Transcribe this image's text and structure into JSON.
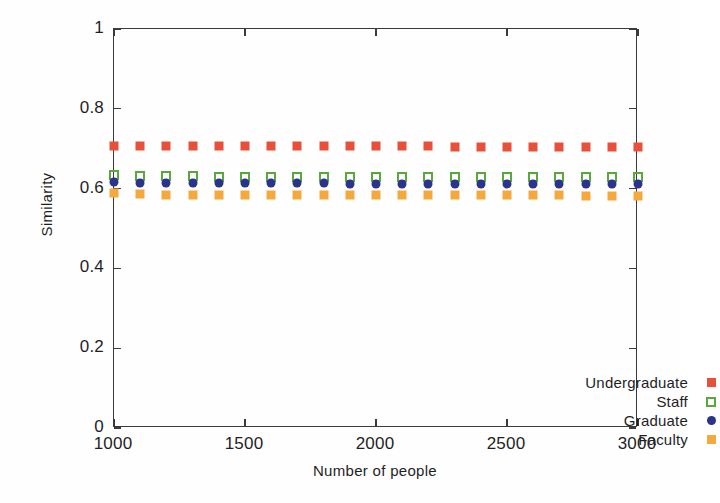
{
  "chart_data": {
    "type": "scatter",
    "title": "",
    "xlabel": "Number of people",
    "ylabel": "Similarity",
    "xlim": [
      1000,
      3000
    ],
    "ylim": [
      0,
      1
    ],
    "xticks": [
      "1000",
      "1500",
      "2000",
      "2500",
      "3000"
    ],
    "xtick_values": [
      1000,
      1500,
      2000,
      2500,
      3000
    ],
    "yticks": [
      "0",
      "0.2",
      "0.4",
      "0.6",
      "0.8",
      "1"
    ],
    "ytick_values": [
      0,
      0.2,
      0.4,
      0.6,
      0.8,
      1
    ],
    "grid": false,
    "legend_position": "lower-right-inside",
    "x": [
      1000,
      1100,
      1200,
      1300,
      1400,
      1500,
      1600,
      1700,
      1800,
      1900,
      2000,
      2100,
      2200,
      2300,
      2400,
      2500,
      2600,
      2700,
      2800,
      2900,
      3000
    ],
    "series": [
      {
        "name": "Undergraduate",
        "color": "#e8503a",
        "marker": "square-filled",
        "values": [
          0.706,
          0.706,
          0.707,
          0.707,
          0.707,
          0.706,
          0.706,
          0.706,
          0.706,
          0.706,
          0.706,
          0.706,
          0.706,
          0.705,
          0.705,
          0.705,
          0.705,
          0.705,
          0.705,
          0.705,
          0.705
        ]
      },
      {
        "name": "Staff",
        "color": "#58a83c",
        "marker": "square-open",
        "values": [
          0.634,
          0.632,
          0.631,
          0.631,
          0.63,
          0.63,
          0.63,
          0.63,
          0.63,
          0.629,
          0.629,
          0.629,
          0.629,
          0.629,
          0.629,
          0.629,
          0.628,
          0.628,
          0.628,
          0.628,
          0.628
        ]
      },
      {
        "name": "Graduate",
        "color": "#2b338c",
        "marker": "circle-filled",
        "values": [
          0.617,
          0.615,
          0.614,
          0.614,
          0.613,
          0.613,
          0.613,
          0.613,
          0.613,
          0.612,
          0.612,
          0.612,
          0.612,
          0.612,
          0.612,
          0.612,
          0.611,
          0.611,
          0.611,
          0.611,
          0.611
        ]
      },
      {
        "name": "Faculty",
        "color": "#f5a93c",
        "marker": "square-filled",
        "values": [
          0.588,
          0.586,
          0.585,
          0.585,
          0.584,
          0.584,
          0.584,
          0.584,
          0.584,
          0.583,
          0.583,
          0.583,
          0.583,
          0.583,
          0.583,
          0.583,
          0.583,
          0.583,
          0.582,
          0.582,
          0.582
        ]
      }
    ]
  },
  "axes": {
    "x_title": "Number of people",
    "y_title": "Similarity"
  },
  "legend": {
    "entries": [
      {
        "label": "Undergraduate",
        "color": "#e8503a",
        "marker": "square-filled"
      },
      {
        "label": "Staff",
        "color": "#58a83c",
        "marker": "square-open"
      },
      {
        "label": "Graduate",
        "color": "#2b338c",
        "marker": "circle-filled"
      },
      {
        "label": "Faculty",
        "color": "#f5a93c",
        "marker": "square-filled"
      }
    ]
  }
}
